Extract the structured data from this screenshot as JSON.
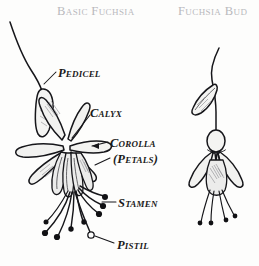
{
  "page": {
    "background_color": "#fdfdfc",
    "ink_color": "#16161a",
    "title_color": "#b9b9bd",
    "label_color": "#1a1a1a"
  },
  "titles": {
    "left": "Basic Fuchsia",
    "right": "Fuchsia Bud"
  },
  "labels": {
    "pedicel": "Pedicel",
    "calyx": "Calyx",
    "corolla": "Corolla",
    "petals": "(Petals)",
    "stamen": "Stamen",
    "pistil": "Pistil"
  },
  "diagram": {
    "type": "botanical-illustration",
    "figures": [
      {
        "name": "basic-fuchsia",
        "title": "Basic Fuchsia",
        "parts": [
          "Pedicel",
          "Calyx",
          "Corolla (Petals)",
          "Stamen",
          "Pistil"
        ],
        "stamen_count": 8,
        "pistil_count": 1,
        "sepal_count": 6
      },
      {
        "name": "fuchsia-bud",
        "title": "Fuchsia Bud",
        "parts": [
          "Pedicel",
          "Leaf",
          "Ovary",
          "Sepals",
          "Corolla",
          "Stamens"
        ],
        "stamen_count": 4,
        "sepal_count": 4
      }
    ]
  }
}
